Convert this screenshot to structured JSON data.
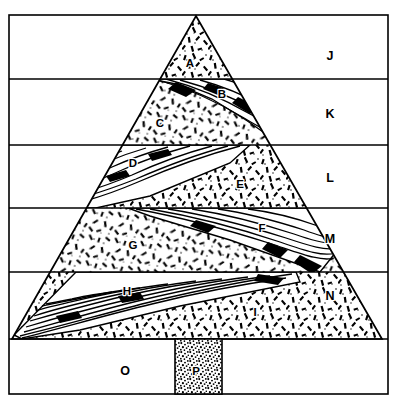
{
  "figure": {
    "kind": "geologic-cross-section",
    "frame": {
      "border_color": "#000000",
      "background_color": "#ffffff"
    }
  },
  "stratigraphic_bands": [
    {
      "id": "J",
      "label": "J",
      "label_x": 330,
      "label_y": 57,
      "top": 15,
      "bottom": 79
    },
    {
      "id": "K",
      "label": "K",
      "label_x": 330,
      "label_y": 115,
      "top": 79,
      "bottom": 145
    },
    {
      "id": "L",
      "label": "L",
      "label_x": 330,
      "label_y": 179,
      "top": 145,
      "bottom": 208
    },
    {
      "id": "M",
      "label": "M",
      "label_x": 330,
      "label_y": 240,
      "top": 208,
      "bottom": 272
    },
    {
      "id": "N",
      "label": "N",
      "label_x": 330,
      "label_y": 297,
      "top": 272,
      "bottom": 339
    },
    {
      "id": "O",
      "label": "O",
      "label_x": 125,
      "label_y": 372,
      "top": 339,
      "bottom": 394
    }
  ],
  "cone_units": [
    {
      "id": "A",
      "label": "A",
      "label_x": 190,
      "label_y": 64,
      "texture": "tephra-stipple"
    },
    {
      "id": "B",
      "label": "B",
      "label_x": 222,
      "label_y": 95,
      "texture": "lava-flowlines"
    },
    {
      "id": "C",
      "label": "C",
      "label_x": 160,
      "label_y": 124,
      "texture": "tephra-stipple"
    },
    {
      "id": "D",
      "label": "D",
      "label_x": 133,
      "label_y": 164,
      "texture": "lava-flowlines"
    },
    {
      "id": "E",
      "label": "E",
      "label_x": 240,
      "label_y": 185,
      "texture": "tephra-stipple"
    },
    {
      "id": "F",
      "label": "F",
      "label_x": 262,
      "label_y": 229,
      "texture": "lava-flowlines"
    },
    {
      "id": "G",
      "label": "G",
      "label_x": 133,
      "label_y": 246,
      "texture": "tephra-stipple"
    },
    {
      "id": "H",
      "label": "H",
      "label_x": 127,
      "label_y": 292,
      "texture": "lava-flowlines"
    },
    {
      "id": "I",
      "label": "I",
      "label_x": 255,
      "label_y": 313,
      "texture": "tephra-stipple"
    }
  ],
  "vent": {
    "id": "P",
    "label": "P",
    "label_x": 196,
    "label_y": 372,
    "texture": "dense-stipple",
    "left": 175,
    "right": 222,
    "top": 339,
    "bottom": 394
  },
  "geometry": {
    "apex_x": 196,
    "apex_y": 16,
    "base_left_x": 12,
    "base_right_x": 382,
    "base_y": 339,
    "frame_left": 9,
    "frame_right": 388,
    "frame_top": 15,
    "frame_bottom": 394
  }
}
